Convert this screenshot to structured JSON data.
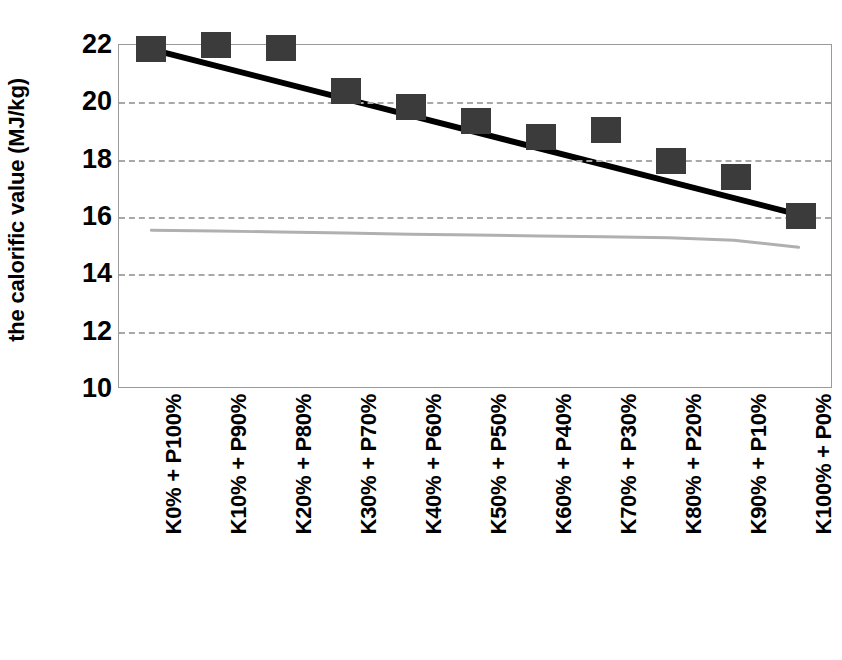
{
  "chart_data": {
    "type": "scatter",
    "title": "",
    "xlabel": "",
    "ylabel": "the calorific value (MJ/kg)",
    "ylim": [
      10,
      22
    ],
    "yticks": [
      22,
      20,
      18,
      16,
      14,
      12,
      10
    ],
    "grid": true,
    "legend": "none",
    "categories": [
      "K0% + P100%",
      "K10% + P90%",
      "K20% + P80%",
      "K30% + P70%",
      "K40% + P60%",
      "K50% + P50%",
      "K60% + P40%",
      "K70% + P30%",
      "K80% + P20%",
      "K90% + P10%",
      "K100% + P0%"
    ],
    "series": [
      {
        "name": "calorific value (measured)",
        "type": "scatter",
        "marker": "square",
        "color": "#3b3b3b",
        "values": [
          21.85,
          22.0,
          21.9,
          20.4,
          19.85,
          19.35,
          18.8,
          19.05,
          17.95,
          17.4,
          16.05
        ]
      },
      {
        "name": "linear trendline",
        "type": "line",
        "color": "#000000",
        "values": [
          21.85,
          21.27,
          20.69,
          20.11,
          19.53,
          18.95,
          18.37,
          17.79,
          17.21,
          16.63,
          16.05
        ]
      },
      {
        "name": "secondary grey curve",
        "type": "line",
        "color": "#b0b0b0",
        "values": [
          15.5,
          15.47,
          15.44,
          15.4,
          15.36,
          15.33,
          15.3,
          15.27,
          15.24,
          15.15,
          14.9
        ]
      }
    ],
    "colors": {
      "marker": "#3b3b3b",
      "trendline": "#000000",
      "grey_curve": "#b0b0b0",
      "gridline": "#a8a8a8",
      "axis": "#9a9a9a",
      "background": "#ffffff"
    }
  }
}
